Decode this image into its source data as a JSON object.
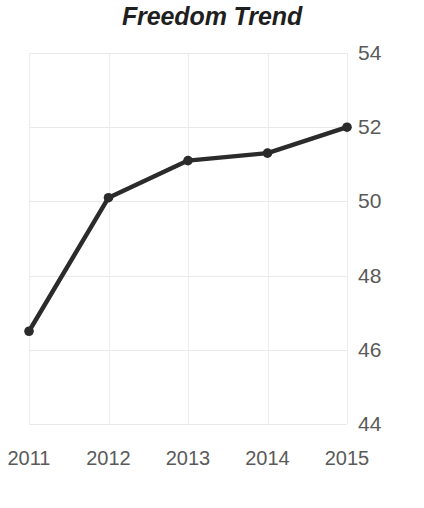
{
  "chart_data": {
    "type": "line",
    "title": "Freedom Trend",
    "xlabel": "",
    "ylabel": "",
    "categories": [
      "2011",
      "2012",
      "2013",
      "2014",
      "2015"
    ],
    "x": [
      2011,
      2012,
      2013,
      2014,
      2015
    ],
    "values": [
      46.5,
      50.1,
      51.1,
      51.3,
      52.0
    ],
    "series": [
      {
        "name": "Freedom Trend",
        "values": [
          46.5,
          50.1,
          51.1,
          51.3,
          52.0
        ]
      }
    ],
    "ylim": [
      44,
      54
    ],
    "yticks": [
      "44",
      "46",
      "48",
      "50",
      "52",
      "54"
    ],
    "ytick_values": [
      44,
      46,
      48,
      50,
      52,
      54
    ],
    "xticks": [
      "2011",
      "2012",
      "2013",
      "2014",
      "2015"
    ],
    "grid": true,
    "legend": "none",
    "line_color": "#2b2b2b",
    "marker_color": "#2b2b2b",
    "grid_color": "#e9e9e9",
    "tick_label_color": "#5a5a5a",
    "title_color": "#1f1f1f",
    "background_color": "#ffffff"
  }
}
